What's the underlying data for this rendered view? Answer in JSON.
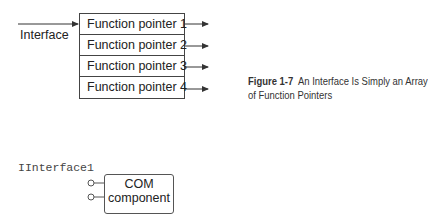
{
  "figure_top": {
    "input_label": "Interface",
    "rows": [
      {
        "label": "Function pointer 1"
      },
      {
        "label": "Function pointer 2"
      },
      {
        "label": "Function pointer 3"
      },
      {
        "label": "Function pointer 4"
      }
    ],
    "caption": {
      "number": "Figure 1-7",
      "line1": "An Interface Is Simply an Array",
      "line2": "of Function Pointers"
    }
  },
  "figure_bottom": {
    "interface_name": "IInterface1",
    "component_line1": "COM",
    "component_line2": "component"
  },
  "colors": {
    "line": "#333333",
    "text": "#222222"
  }
}
